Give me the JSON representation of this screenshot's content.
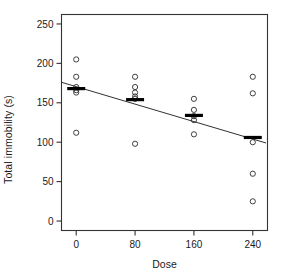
{
  "chart_data": {
    "type": "scatter",
    "title": "",
    "xlabel": "Dose",
    "ylabel": "Total immobility (s)",
    "xlim": [
      -20,
      260
    ],
    "ylim": [
      -12,
      262
    ],
    "xticks": [
      0,
      80,
      160,
      240
    ],
    "xtick_labels": [
      "0",
      "80",
      "160",
      "240"
    ],
    "yticks": [
      0,
      50,
      100,
      150,
      200,
      250
    ],
    "ytick_labels": [
      "0",
      "50",
      "100",
      "150",
      "200",
      "250"
    ],
    "grid": false,
    "legend": null,
    "frame": "box",
    "marker": "open-circle",
    "series": [
      {
        "name": "Total immobility observations",
        "points": [
          {
            "x": 0,
            "y": 205
          },
          {
            "x": 0,
            "y": 183
          },
          {
            "x": 0,
            "y": 170
          },
          {
            "x": 0,
            "y": 166
          },
          {
            "x": 0,
            "y": 163
          },
          {
            "x": 0,
            "y": 112
          },
          {
            "x": 80,
            "y": 183
          },
          {
            "x": 80,
            "y": 170
          },
          {
            "x": 80,
            "y": 163
          },
          {
            "x": 80,
            "y": 158
          },
          {
            "x": 80,
            "y": 155
          },
          {
            "x": 80,
            "y": 98
          },
          {
            "x": 160,
            "y": 155
          },
          {
            "x": 160,
            "y": 141
          },
          {
            "x": 160,
            "y": 133
          },
          {
            "x": 160,
            "y": 128
          },
          {
            "x": 160,
            "y": 110
          },
          {
            "x": 240,
            "y": 183
          },
          {
            "x": 240,
            "y": 162
          },
          {
            "x": 240,
            "y": 100
          },
          {
            "x": 240,
            "y": 60
          },
          {
            "x": 240,
            "y": 25
          }
        ]
      }
    ],
    "group_means": [
      {
        "x": 0,
        "mean": 168
      },
      {
        "x": 80,
        "mean": 154
      },
      {
        "x": 160,
        "mean": 134
      },
      {
        "x": 240,
        "mean": 106
      }
    ],
    "fit_line": {
      "type": "linear-regression",
      "x_start": -20,
      "y_start": 176,
      "x_end": 258,
      "y_end": 99,
      "intercept": 170.5,
      "slope": -0.277
    }
  }
}
